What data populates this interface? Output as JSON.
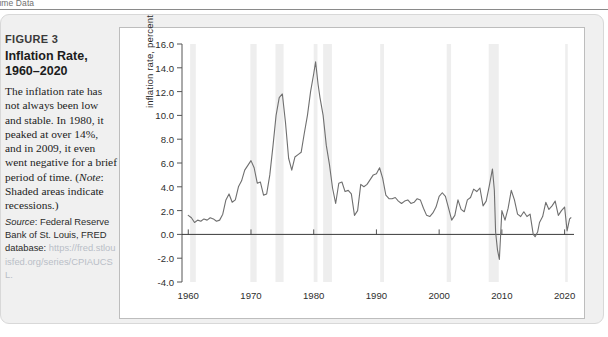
{
  "running_header": {
    "text": "l-time Data"
  },
  "figure": {
    "number": "FIGURE 3",
    "title": "Inflation Rate, 1960–2020",
    "description": "The inflation rate has not always been low and stable. In 1980, it peaked at over 14%, and in 2009, it even went negative for a brief period of time. (",
    "note_label": "Note",
    "note_text": ": Shaded areas indicate recessions.)",
    "source_label": "Source",
    "source_text": ": Federal Reserve Bank of St. Louis, FRED database: ",
    "source_url": "https://fred.stlouisfed.org/series/CPIAUCSL."
  },
  "colors": {
    "card_background": "#f0f0f0",
    "panel_background": "#ffffff",
    "panel_border": "#bdbdbd",
    "line": "#6f6f6f",
    "zero_line": "#3a3a3a",
    "recession_band": "#eeeeee",
    "tick_text": "#2e2e2e",
    "url_text": "#b9bec7"
  },
  "chart_data": {
    "type": "line",
    "title": "Inflation Rate, 1960–2020",
    "xlabel": "",
    "ylabel": "inflation rate, percent",
    "xlim": [
      1959.0,
      2021.5
    ],
    "ylim": [
      -4.0,
      16.0
    ],
    "grid": false,
    "legend": "none",
    "yticks": [
      16.0,
      14.0,
      12.0,
      10.0,
      8.0,
      6.0,
      4.0,
      2.0,
      0.0,
      -2.0,
      -4.0
    ],
    "ytick_labels": [
      "16.0",
      "14.0",
      "12.0",
      "10.0",
      "8.0",
      "6.0",
      "4.0",
      "2.0",
      "0.0",
      "-2.0",
      "-4.0"
    ],
    "xticks": [
      1960,
      1970,
      1980,
      1990,
      2000,
      2010,
      2020
    ],
    "xtick_labels": [
      "1960",
      "1970",
      "1980",
      "1990",
      "2000",
      "2010",
      "2020"
    ],
    "zero_line": 0.0,
    "recessions": [
      {
        "start": 1960.3,
        "end": 1961.2
      },
      {
        "start": 1969.9,
        "end": 1970.9
      },
      {
        "start": 1973.9,
        "end": 1975.2
      },
      {
        "start": 1980.0,
        "end": 1980.6
      },
      {
        "start": 1981.5,
        "end": 1982.9
      },
      {
        "start": 1990.6,
        "end": 1991.2
      },
      {
        "start": 2001.2,
        "end": 2001.9
      },
      {
        "start": 2007.9,
        "end": 2009.5
      },
      {
        "start": 2020.1,
        "end": 2020.5
      }
    ],
    "series": [
      {
        "name": "CPI inflation rate, percent",
        "color": "#6f6f6f",
        "x": [
          1960.0,
          1960.5,
          1961.0,
          1961.5,
          1962.0,
          1962.5,
          1963.0,
          1963.5,
          1964.0,
          1964.5,
          1965.0,
          1965.5,
          1966.0,
          1966.5,
          1967.0,
          1967.5,
          1968.0,
          1968.5,
          1969.0,
          1969.5,
          1970.0,
          1970.5,
          1971.0,
          1971.5,
          1972.0,
          1972.5,
          1973.0,
          1973.5,
          1974.0,
          1974.5,
          1975.0,
          1975.5,
          1976.0,
          1976.5,
          1977.0,
          1977.5,
          1978.0,
          1978.5,
          1979.0,
          1979.5,
          1980.0,
          1980.3,
          1980.7,
          1981.0,
          1981.5,
          1982.0,
          1982.5,
          1983.0,
          1983.5,
          1984.0,
          1984.5,
          1985.0,
          1985.5,
          1986.0,
          1986.5,
          1987.0,
          1987.5,
          1988.0,
          1988.5,
          1989.0,
          1989.5,
          1990.0,
          1990.5,
          1991.0,
          1991.5,
          1992.0,
          1992.5,
          1993.0,
          1993.5,
          1994.0,
          1994.5,
          1995.0,
          1995.5,
          1996.0,
          1996.5,
          1997.0,
          1997.5,
          1998.0,
          1998.5,
          1999.0,
          1999.5,
          2000.0,
          2000.5,
          2001.0,
          2001.5,
          2002.0,
          2002.5,
          2003.0,
          2003.5,
          2004.0,
          2004.5,
          2005.0,
          2005.5,
          2006.0,
          2006.5,
          2007.0,
          2007.5,
          2008.0,
          2008.5,
          2008.8,
          2009.0,
          2009.3,
          2009.6,
          2010.0,
          2010.5,
          2011.0,
          2011.5,
          2012.0,
          2012.5,
          2013.0,
          2013.5,
          2014.0,
          2014.5,
          2015.0,
          2015.3,
          2015.7,
          2016.0,
          2016.5,
          2017.0,
          2017.5,
          2018.0,
          2018.5,
          2019.0,
          2019.5,
          2020.0,
          2020.4,
          2020.8,
          2021.0
        ],
        "y": [
          1.6,
          1.4,
          1.0,
          1.2,
          1.1,
          1.3,
          1.2,
          1.4,
          1.3,
          1.1,
          1.2,
          1.7,
          2.9,
          3.4,
          2.7,
          2.9,
          4.0,
          4.5,
          5.4,
          5.8,
          6.2,
          5.6,
          4.3,
          4.4,
          3.3,
          3.4,
          5.0,
          7.4,
          10.0,
          11.5,
          11.8,
          9.4,
          6.4,
          5.4,
          6.5,
          6.7,
          6.9,
          8.5,
          10.0,
          12.0,
          13.5,
          14.5,
          12.6,
          11.5,
          10.0,
          7.5,
          5.9,
          3.9,
          2.6,
          4.3,
          4.4,
          3.6,
          3.7,
          3.4,
          1.6,
          2.0,
          4.2,
          4.0,
          4.2,
          4.6,
          5.0,
          5.1,
          5.6,
          4.7,
          3.3,
          3.0,
          3.0,
          3.1,
          2.8,
          2.6,
          2.8,
          2.9,
          2.6,
          2.7,
          3.0,
          2.9,
          2.2,
          1.6,
          1.5,
          1.8,
          2.3,
          3.2,
          3.5,
          3.2,
          2.2,
          1.2,
          1.6,
          2.9,
          2.1,
          1.9,
          2.9,
          3.1,
          3.8,
          3.6,
          3.9,
          2.4,
          2.8,
          4.1,
          5.5,
          3.7,
          0.2,
          -1.3,
          -2.1,
          2.0,
          1.2,
          2.2,
          3.7,
          2.9,
          1.7,
          1.5,
          1.9,
          1.5,
          1.7,
          0.0,
          -0.2,
          0.2,
          1.0,
          1.5,
          2.7,
          2.1,
          2.4,
          2.8,
          1.6,
          2.0,
          2.3,
          0.3,
          1.3,
          1.4
        ]
      }
    ]
  }
}
